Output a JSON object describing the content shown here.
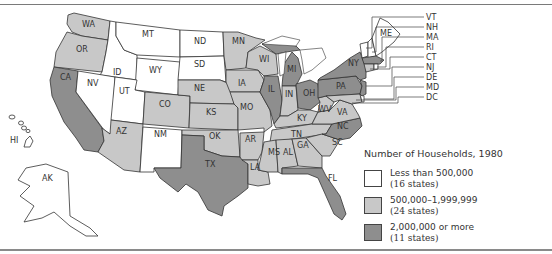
{
  "map": {
    "title": "Number of Households, 1980",
    "colors": {
      "low": "#ffffff",
      "mid": "#c8c8c8",
      "high": "#8e8e8e",
      "border": "#333333"
    },
    "legend": [
      {
        "key": "low",
        "range": "Less than 500,000",
        "count": "(16 states)"
      },
      {
        "key": "mid",
        "range": "500,000–1,999,999",
        "count": "(24 states)"
      },
      {
        "key": "high",
        "range": "2,000,000 or more",
        "count": "(11 states)"
      }
    ],
    "state_labels": {
      "WA": "WA",
      "OR": "OR",
      "CA": "CA",
      "ID": "ID",
      "NV": "NV",
      "MT": "MT",
      "WY": "WY",
      "UT": "UT",
      "AZ": "AZ",
      "CO": "CO",
      "NM": "NM",
      "ND": "ND",
      "SD": "SD",
      "NE": "NE",
      "KS": "KS",
      "OK": "OK",
      "TX": "TX",
      "MN": "MN",
      "IA": "IA",
      "MO": "MO",
      "AR": "AR",
      "LA": "LA",
      "WI": "WI",
      "IL": "IL",
      "MI": "MI",
      "IN": "IN",
      "OH": "OH",
      "KY": "KY",
      "TN": "TN",
      "MS": "MS",
      "AL": "AL",
      "GA": "GA",
      "FL": "FL",
      "SC": "SC",
      "NC": "NC",
      "VA": "VA",
      "WV": "WV",
      "PA": "PA",
      "NY": "NY",
      "ME": "ME",
      "AK": "AK",
      "HI": "HI"
    },
    "callouts": [
      "VT",
      "NH",
      "MA",
      "RI",
      "CT",
      "NJ",
      "DE",
      "MD",
      "DC"
    ],
    "state_categories": {
      "low": [
        "MT",
        "ND",
        "SD",
        "WY",
        "ID",
        "NV",
        "UT",
        "NM",
        "ME",
        "VT",
        "NH",
        "RI",
        "DE",
        "DC",
        "AK",
        "HI"
      ],
      "mid": [
        "WA",
        "OR",
        "CO",
        "AZ",
        "NE",
        "KS",
        "OK",
        "MN",
        "IA",
        "MO",
        "AR",
        "LA",
        "WI",
        "IN",
        "KY",
        "TN",
        "MS",
        "AL",
        "GA",
        "SC",
        "WV",
        "VA",
        "CT",
        "MD"
      ],
      "high": [
        "CA",
        "TX",
        "IL",
        "MI",
        "OH",
        "PA",
        "NY",
        "NJ",
        "MA",
        "NC",
        "FL"
      ]
    }
  }
}
